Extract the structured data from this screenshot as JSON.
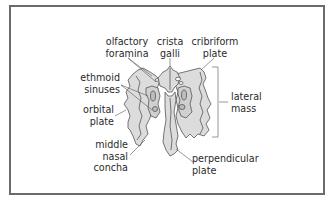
{
  "diagram": {
    "colors": {
      "bone_fill": "#dcdcdc",
      "outline": "#555555",
      "sinus_fill": "#bdbdbd",
      "text": "#2a2a2a",
      "frame": "#6b6b6b"
    },
    "labels": {
      "olfactory_foramina": {
        "line1": "olfactory",
        "line2": "foramina"
      },
      "crista_galli": {
        "line1": "crista",
        "line2": "galli"
      },
      "cribriform_plate": {
        "line1": "cribriform",
        "line2": "plate"
      },
      "ethmoid_sinuses": {
        "line1": "ethmoid",
        "line2": "sinuses"
      },
      "orbital_plate": {
        "line1": "orbital",
        "line2": "plate"
      },
      "middle_nasal_concha": {
        "line1": "middle",
        "line2": "nasal",
        "line3": "concha"
      },
      "lateral_mass": {
        "line1": "lateral",
        "line2": "mass"
      },
      "perpendicular_plate": {
        "line1": "perpendicular",
        "line2": "plate"
      }
    }
  }
}
